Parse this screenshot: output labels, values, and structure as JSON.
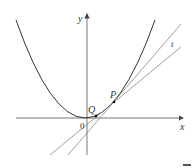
{
  "diagram": {
    "type": "tangent-secant-parabola",
    "labels": {
      "y_axis": "y",
      "x_axis": "x",
      "origin": "0",
      "point_P": "P",
      "point_Q": "Q",
      "tangent": "t"
    },
    "colors": {
      "curve": "#333333",
      "axes": "#555555",
      "lines": "#888888",
      "points": "#111111"
    }
  }
}
